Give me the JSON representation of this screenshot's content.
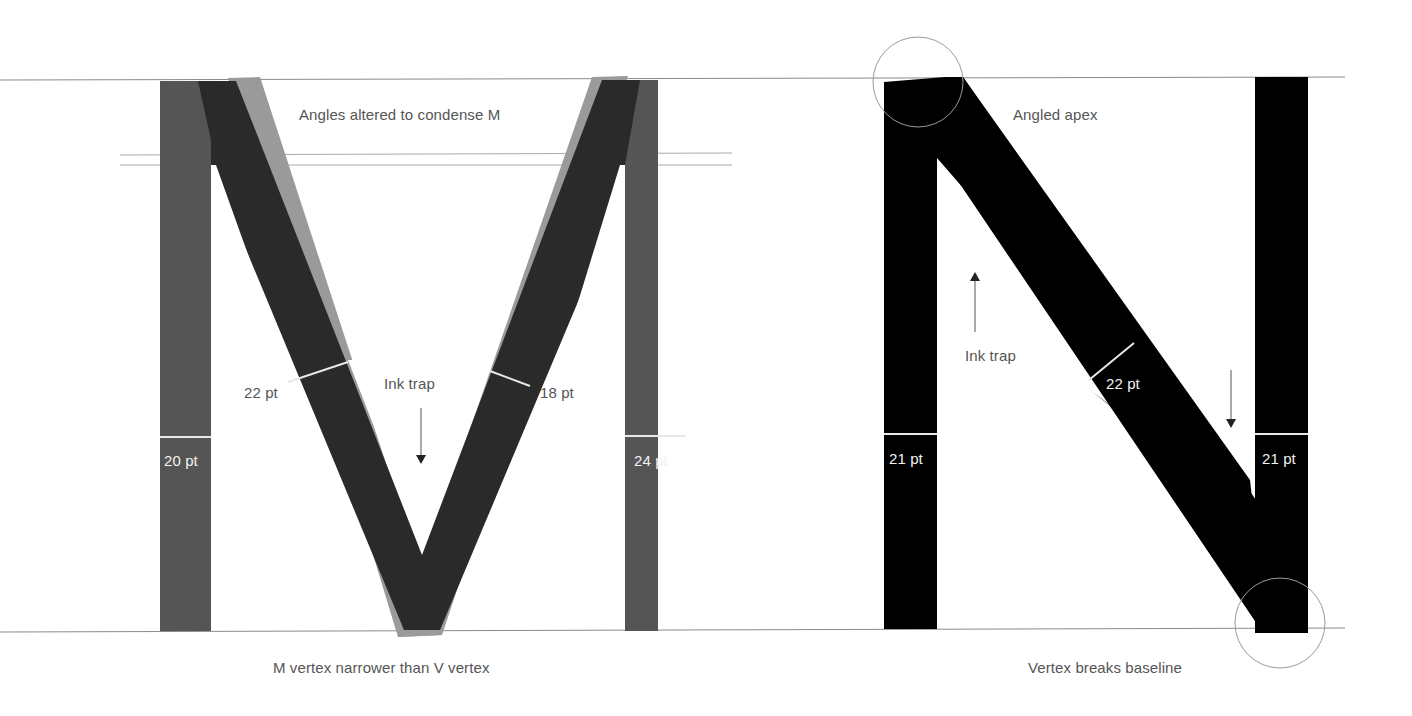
{
  "colors": {
    "background": "#ffffff",
    "guide_line": "#8a8a8a",
    "m_stem": "#555555",
    "m_diagonal": "#2a2a2a",
    "v_overlay": "#9a9a9a",
    "n_glyph": "#000000",
    "label_text": "#555555",
    "label_text_on_dark": "#f2f2f2",
    "callout_circle": "#9a9a9a"
  },
  "m_panel": {
    "annotations": {
      "angles": "Angles altered to condense M",
      "ink_trap": "Ink trap",
      "vertex_note": "M vertex narrower than V vertex"
    },
    "measurements": {
      "left_diagonal": "22 pt",
      "right_diagonal": "18 pt",
      "left_stem": "20 pt",
      "right_stem": "24 pt"
    }
  },
  "n_panel": {
    "annotations": {
      "apex": "Angled apex",
      "ink_trap": "Ink trap",
      "vertex_note": "Vertex breaks baseline"
    },
    "measurements": {
      "left_stem": "21 pt",
      "diagonal": "22 pt",
      "right_stem": "21 pt"
    }
  }
}
